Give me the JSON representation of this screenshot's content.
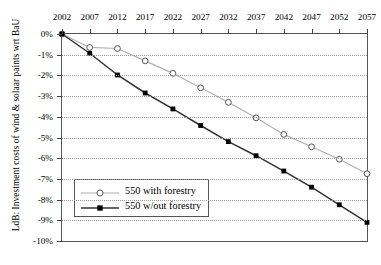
{
  "chart_data": {
    "type": "line",
    "title": "",
    "xlabel": "",
    "ylabel": "LdB: Investment costs of wind & solaar paints wrt BaU",
    "categories": [
      "2002",
      "2007",
      "2012",
      "2017",
      "2022",
      "2027",
      "2032",
      "2037",
      "2042",
      "2047",
      "2052",
      "2057"
    ],
    "x_tick_labels": [
      "2002",
      "2007",
      "2012",
      "2017",
      "2022",
      "2027",
      "2032",
      "2037",
      "2042",
      "2047",
      "2052",
      "2057"
    ],
    "y_tick_labels": [
      "0%",
      "-1%",
      "-2%",
      "-3%",
      "-4%",
      "-5%",
      "-6%",
      "-7%",
      "-8%",
      "-9%",
      "-10%"
    ],
    "y_tick_values": [
      0,
      -1,
      -2,
      -3,
      -4,
      -5,
      -6,
      -7,
      -8,
      -9,
      -10
    ],
    "ylim": [
      -10,
      0
    ],
    "xlim": [
      2002,
      2057
    ],
    "grid": "horizontal-dotted",
    "x_axis_position": "top",
    "legend_position": "lower-left-inside",
    "series": [
      {
        "name": "550 with forestry",
        "marker": "open-circle",
        "color": "#b0b0b0",
        "marker_edge_color": "#555555",
        "values": [
          0,
          -0.65,
          -0.7,
          -1.3,
          -1.9,
          -2.6,
          -3.3,
          -4.05,
          -4.85,
          -5.45,
          -6.05,
          -6.75
        ]
      },
      {
        "name": "550 w/out forestry",
        "marker": "filled-square",
        "color": "#333333",
        "marker_edge_color": "#000000",
        "values": [
          0,
          -0.93,
          -1.98,
          -2.85,
          -3.62,
          -4.42,
          -5.2,
          -5.88,
          -6.62,
          -7.4,
          -8.25,
          -9.1
        ]
      }
    ]
  },
  "legend": {
    "items": [
      {
        "label": "550 with forestry"
      },
      {
        "label": "550 w/out forestry"
      }
    ]
  },
  "colors": {
    "series_light": "#b0b0b0",
    "series_dark": "#333333",
    "grid": "#9a9a9a",
    "axis": "#555555"
  }
}
